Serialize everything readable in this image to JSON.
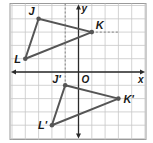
{
  "diagram": {
    "type": "coordinate-plane-translation",
    "grid": {
      "xmin": -5,
      "xmax": 5,
      "ymin": -5,
      "ymax": 5,
      "step": 1
    },
    "axes": {
      "x_label": "x",
      "y_label": "y",
      "origin_label": "O"
    },
    "colors": {
      "grid": "#c8c8c8",
      "axis": "#2a2a2a",
      "triangle": "#555555",
      "dashed": "#777777",
      "label": "#1a1a1a",
      "border": "#9a9a9a"
    },
    "preimage": {
      "name": "triangle-JKL",
      "vertices": [
        {
          "label": "J",
          "x": -3,
          "y": 4
        },
        {
          "label": "K",
          "x": 1,
          "y": 3
        },
        {
          "label": "L",
          "x": -4,
          "y": 1
        }
      ]
    },
    "image": {
      "name": "triangle-J'K'L'",
      "vertices": [
        {
          "label": "J'",
          "x": -1,
          "y": -1
        },
        {
          "label": "K'",
          "x": 3,
          "y": -2
        },
        {
          "label": "L'",
          "x": -2,
          "y": -4
        }
      ]
    },
    "dashed_guides": [
      {
        "from": {
          "x": -1,
          "y": 5
        },
        "to": {
          "x": -1,
          "y": -1
        }
      },
      {
        "from": {
          "x": 1,
          "y": 3
        },
        "to": {
          "x": 3,
          "y": 3
        }
      }
    ]
  }
}
